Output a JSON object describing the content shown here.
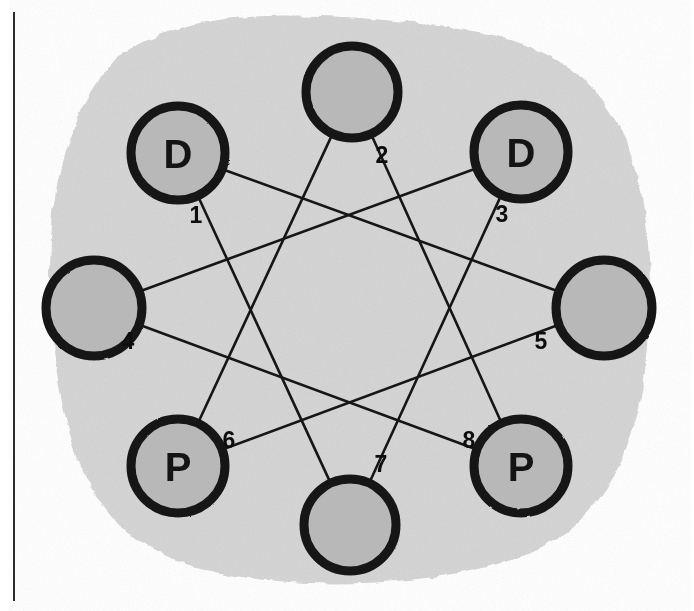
{
  "figure": {
    "background_color": "#ffffff",
    "blob_color": "#d6d6d6",
    "node_fill_color": "#b8b8b8",
    "node_stroke_color": "#141414",
    "edge_color": "#161616",
    "label_color": "#0d0d0d",
    "rule_color": "#2b2b2b"
  },
  "left_rule": {
    "name": "vertical-rule",
    "x": 14,
    "y_start": 12,
    "y_end": 601,
    "width": 2
  },
  "nodes": [
    {
      "index": "1",
      "letter": "D",
      "cx": 178,
      "cy": 153,
      "r": 47,
      "label_x": 196,
      "label_y": 215,
      "anchor_x": 213,
      "anchor_y": 189
    },
    {
      "index": "2",
      "letter": "",
      "cx": 352,
      "cy": 92,
      "r": 46,
      "label_x": 382,
      "label_y": 155,
      "anchor_x": 358,
      "anchor_y": 138
    },
    {
      "index": "3",
      "letter": "D",
      "cx": 521,
      "cy": 152,
      "r": 47,
      "label_x": 502,
      "label_y": 214,
      "anchor_x": 486,
      "anchor_y": 188
    },
    {
      "index": "4",
      "letter": "",
      "cx": 94,
      "cy": 308,
      "r": 48,
      "label_x": 128,
      "label_y": 341,
      "anchor_x": 142,
      "anchor_y": 308
    },
    {
      "index": "5",
      "letter": "",
      "cx": 604,
      "cy": 308,
      "r": 48,
      "label_x": 541,
      "label_y": 341,
      "anchor_x": 556,
      "anchor_y": 308
    },
    {
      "index": "6",
      "letter": "P",
      "cx": 178,
      "cy": 466,
      "r": 47,
      "label_x": 229,
      "label_y": 440,
      "anchor_x": 212,
      "anchor_y": 431
    },
    {
      "index": "7",
      "letter": "",
      "cx": 350,
      "cy": 525,
      "r": 46,
      "label_x": 381,
      "label_y": 464,
      "anchor_x": 350,
      "anchor_y": 479
    },
    {
      "index": "8",
      "letter": "P",
      "cx": 521,
      "cy": 466,
      "r": 47,
      "label_x": 469,
      "label_y": 440,
      "anchor_x": 487,
      "anchor_y": 431
    }
  ],
  "edges": [
    {
      "name": "edge-1-5",
      "from": "1",
      "to": "5"
    },
    {
      "name": "edge-1-7",
      "from": "1",
      "to": "7"
    },
    {
      "name": "edge-2-6",
      "from": "2",
      "to": "6"
    },
    {
      "name": "edge-2-8",
      "from": "2",
      "to": "8"
    },
    {
      "name": "edge-3-4",
      "from": "3",
      "to": "4"
    },
    {
      "name": "edge-3-7",
      "from": "3",
      "to": "7"
    },
    {
      "name": "edge-4-8",
      "from": "4",
      "to": "8"
    },
    {
      "name": "edge-5-6",
      "from": "5",
      "to": "6"
    }
  ],
  "blob_path": "M 112 62 C 150 30 206 18 268 16 C 330 14 400 20 466 30 C 520 38 566 58 596 92 C 626 126 640 172 646 224 C 652 278 652 336 642 392 C 632 448 610 494 576 524 C 542 554 494 568 440 576 C 386 584 326 586 266 580 C 206 574 152 558 120 526 C 88 494 70 446 60 392 C 50 338 48 280 52 224 C 56 168 74 110 112 62 Z"
}
